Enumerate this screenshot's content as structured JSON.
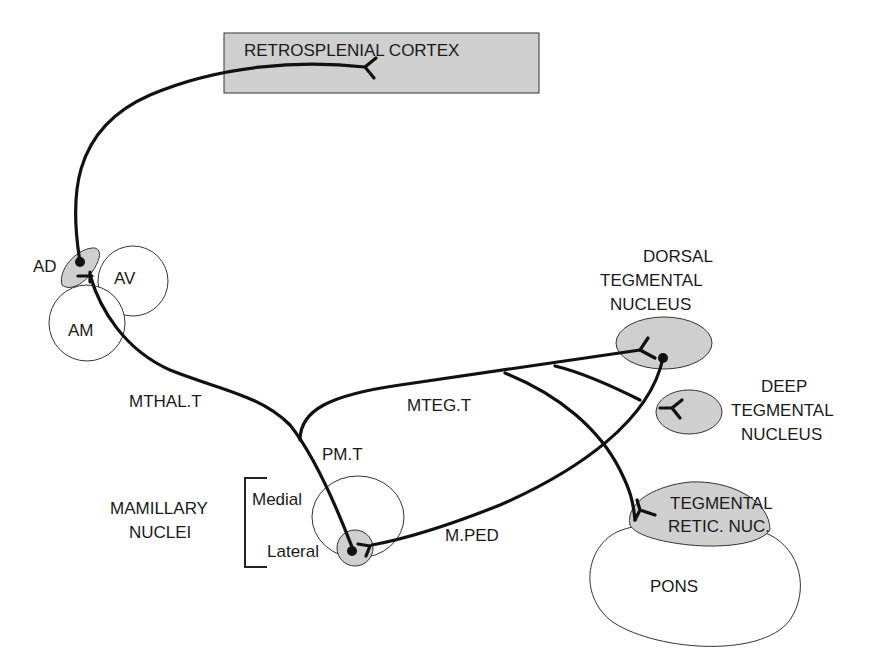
{
  "diagram": {
    "structures": {
      "retrosplenial_cortex": "RETROSPLENIAL CORTEX",
      "ad": "AD",
      "av": "AV",
      "am": "AM",
      "dorsal_tegmental": [
        "DORSAL",
        "TEGMENTAL",
        "NUCLEUS"
      ],
      "deep_tegmental": [
        "DEEP",
        "TEGMENTAL",
        "NUCLEUS"
      ],
      "tegmental_retic": [
        "TEGMENTAL",
        "RETIC. NUC."
      ],
      "pons": "PONS",
      "mamillary_nuclei": [
        "MAMILLARY",
        "NUCLEI"
      ],
      "medial": "Medial",
      "lateral": "Lateral"
    },
    "tracts": {
      "mthal": "MTHAL.T",
      "mteg": "MTEG.T",
      "pm": "PM.T",
      "mped": "M.PED"
    },
    "colors": {
      "nucleus_fill": "#cfcfcf",
      "line": "#111111",
      "background": "#ffffff"
    }
  }
}
